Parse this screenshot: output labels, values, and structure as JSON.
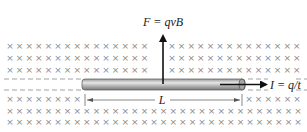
{
  "figure": {
    "force_label": "F = qvB",
    "current_label": "I = q/t",
    "length_label": "L",
    "field_symbol": "×",
    "field_direction": "into page",
    "colors": {
      "field_marks": "#8a8a8a",
      "rod_fill": "#b8b8b8",
      "rod_highlight": "#e6e6e6",
      "arrows": "#111111",
      "dashed": "#8a8a8a"
    },
    "field_rows": {
      "top_rows_y": [
        46,
        58,
        70
      ],
      "bottom_rows_y": [
        99,
        111,
        122
      ]
    }
  }
}
